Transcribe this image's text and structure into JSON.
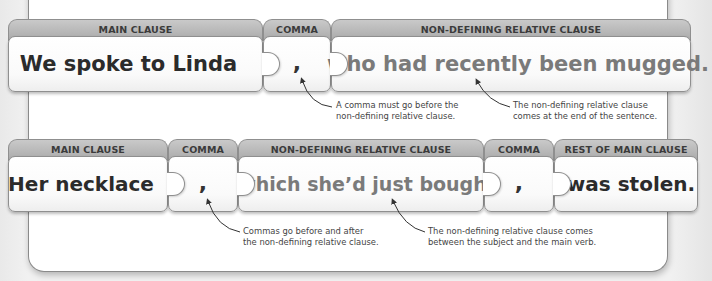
{
  "row1": {
    "pieces": [
      {
        "header": "MAIN CLAUSE",
        "text": "We spoke to Linda"
      },
      {
        "header": "COMMA",
        "text": ","
      },
      {
        "header": "NON-DEFINING RELATIVE CLAUSE",
        "text": "who had recently been mugged."
      }
    ],
    "notes": [
      {
        "line1": "A comma must go before the",
        "line2": "non-defining relative clause."
      },
      {
        "line1": "The non-defining relative clause",
        "line2": "comes at the end of the sentence."
      }
    ]
  },
  "row2": {
    "pieces": [
      {
        "header": "MAIN CLAUSE",
        "text": "Her necklace"
      },
      {
        "header": "COMMA",
        "text": ","
      },
      {
        "header": "NON-DEFINING RELATIVE CLAUSE",
        "text": "which she’d just bought"
      },
      {
        "header": "COMMA",
        "text": ","
      },
      {
        "header": "REST OF MAIN CLAUSE",
        "text": "was stolen."
      }
    ],
    "notes": [
      {
        "line1": "Commas go before and after",
        "line2": "the non-defining relative clause."
      },
      {
        "line1": "The non-defining relative clause comes",
        "line2": "between the subject and the main verb."
      }
    ]
  },
  "colors": {
    "tab": "#b3b3b3",
    "main_text": "#2b2b2b",
    "relative_clause_text": "#7a7a7a"
  }
}
